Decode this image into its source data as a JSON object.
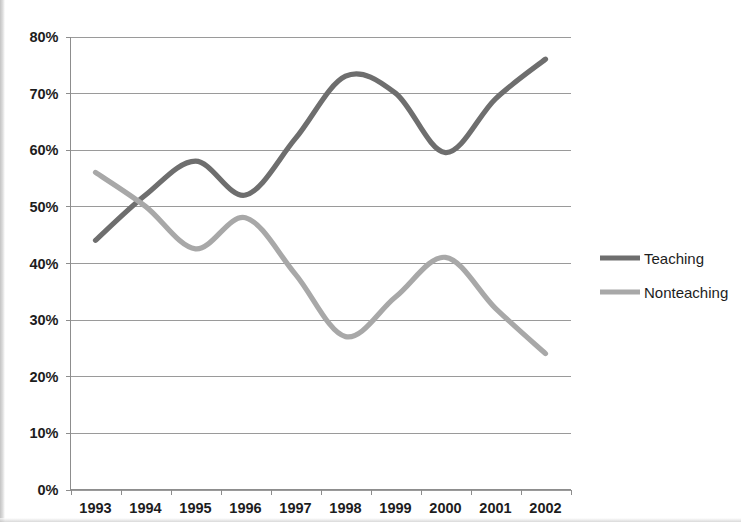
{
  "chart_data": {
    "type": "line",
    "title": "",
    "subtitle": "",
    "xlabel": "",
    "ylabel": "",
    "categories": [
      "1993",
      "1994",
      "1995",
      "1996",
      "1997",
      "1998",
      "1999",
      "2000",
      "2001",
      "2002"
    ],
    "series": [
      {
        "name": "Teaching",
        "color": "#6e6e6e",
        "values": [
          44,
          52,
          58,
          52,
          62,
          73,
          70,
          59.5,
          69,
          76
        ]
      },
      {
        "name": "Nonteaching",
        "color": "#a8a8a8",
        "values": [
          56,
          50,
          42.5,
          48,
          38,
          27,
          34,
          41,
          32,
          24
        ]
      }
    ],
    "ylim": [
      0,
      80
    ],
    "ytick_values": [
      0,
      10,
      20,
      30,
      40,
      50,
      60,
      70,
      80
    ],
    "ytick_labels": [
      "0%",
      "10%",
      "20%",
      "30%",
      "40%",
      "50%",
      "60%",
      "70%",
      "80%"
    ],
    "xtick_labels": [
      "1993",
      "1994",
      "1995",
      "1996",
      "1997",
      "1998",
      "1999",
      "2000",
      "2001",
      "2002"
    ],
    "grid": "horizontal",
    "smoothing": "spline",
    "legend_position": "right",
    "legend_entries": [
      "Teaching",
      "Nonteaching"
    ],
    "background_color": "#ffffff",
    "gridline_color": "#9a9a9a",
    "axis_color": "#8d8d8d",
    "text_color": "#1d1d1d"
  },
  "legend": {
    "items": [
      {
        "label": "Teaching",
        "color": "#6e6e6e"
      },
      {
        "label": "Nonteaching",
        "color": "#a8a8a8"
      }
    ]
  },
  "axes": {
    "y": {
      "labels": [
        "80%",
        "70%",
        "60%",
        "50%",
        "40%",
        "30%",
        "20%",
        "10%",
        "0%"
      ]
    },
    "x": {
      "labels": [
        "1993",
        "1994",
        "1995",
        "1996",
        "1997",
        "1998",
        "1999",
        "2000",
        "2001",
        "2002"
      ]
    }
  }
}
